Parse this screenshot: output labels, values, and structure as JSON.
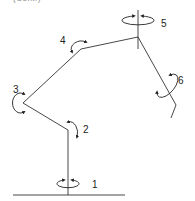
{
  "caption": "(Cont.)",
  "diagram": {
    "type": "robot-arm-kinematic-chain",
    "joints": [
      {
        "id": 1,
        "label": "1",
        "rotation": "about vertical base axis"
      },
      {
        "id": 2,
        "label": "2",
        "rotation": "shoulder pitch"
      },
      {
        "id": 3,
        "label": "3",
        "rotation": "elbow pitch"
      },
      {
        "id": 4,
        "label": "4",
        "rotation": "wrist pitch"
      },
      {
        "id": 5,
        "label": "5",
        "rotation": "about vertical axis"
      },
      {
        "id": 6,
        "label": "6",
        "rotation": "about end link axis"
      }
    ]
  },
  "colors": {
    "line": "#333333",
    "background": "#ffffff"
  }
}
